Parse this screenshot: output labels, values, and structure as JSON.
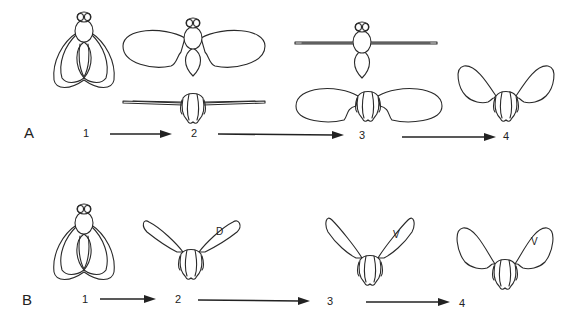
{
  "figure": {
    "panels": [
      {
        "id": "A",
        "label": "A",
        "steps": [
          {
            "number": "1",
            "view": "dorsal, wings folded at rest"
          },
          {
            "number": "2",
            "view": "wings spread horizontally (dorsal) / wings extended level (frontal)"
          },
          {
            "number": "3",
            "view": "wings extended level (dorsal) / wings spread horizontally (frontal)"
          },
          {
            "number": "4",
            "view": "frontal, wings raised"
          }
        ]
      },
      {
        "id": "B",
        "label": "B",
        "steps": [
          {
            "number": "1",
            "view": "dorsal, wings folded at rest"
          },
          {
            "number": "2",
            "view": "frontal, wings raised in V",
            "wing_label": "D"
          },
          {
            "number": "3",
            "view": "frontal, wings raised in V",
            "wing_label": "V"
          },
          {
            "number": "4",
            "view": "frontal, wings raised and spread",
            "wing_label": "V"
          }
        ]
      }
    ],
    "arrow_icon": "right-arrow-icon",
    "line_color": "#2a2a2a",
    "background": "#ffffff"
  }
}
